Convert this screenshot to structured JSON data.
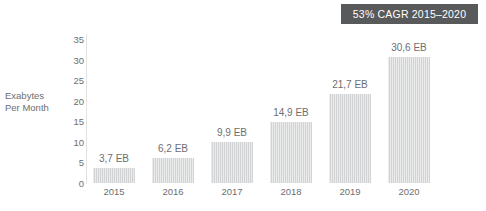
{
  "badge": {
    "label": "53% CAGR 2015–2020",
    "background": "#58595b",
    "text_color": "#ffffff"
  },
  "axis_title": {
    "line1": "Exabytes",
    "line2": "Per Month"
  },
  "source_note": "",
  "chart_data": {
    "type": "bar",
    "title": "",
    "subtitle": "",
    "xlabel": "",
    "ylabel": "Exabytes Per Month",
    "categories": [
      "2015",
      "2016",
      "2017",
      "2018",
      "2019",
      "2020"
    ],
    "values": [
      3.7,
      6.2,
      9.9,
      14.9,
      21.7,
      30.6
    ],
    "data_labels": [
      "3,7 EB",
      "6,2 EB",
      "9,9 EB",
      "14,9 EB",
      "21,7 EB",
      "30,6 EB"
    ],
    "unit": "EB",
    "ylim": [
      0,
      35
    ],
    "yticks": [
      35,
      30,
      25,
      20,
      15,
      10,
      5,
      0
    ],
    "ytick_labels": [
      "35",
      "30",
      "25",
      "20",
      "15",
      "10",
      "5",
      "0"
    ],
    "grid": false,
    "legend": "none",
    "bar_color": "#d2d3d4",
    "annotation": "53% CAGR 2015–2020"
  }
}
